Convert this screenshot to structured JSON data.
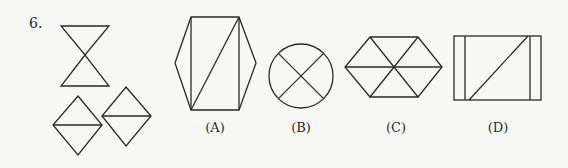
{
  "question": {
    "number": "6.",
    "figure_description": "Three given pieces: an hourglass (two triangles meeting at a point) and two squares rotated 45° each split by a horizontal line into two triangles.",
    "options": [
      {
        "label": "(A)",
        "shape": "hexagon divided by two verticals and one diagonal"
      },
      {
        "label": "(B)",
        "shape": "circle divided by an X"
      },
      {
        "label": "(C)",
        "shape": "regular hexagon divided into six triangles"
      },
      {
        "label": "(D)",
        "shape": "rectangle with two inner vertical lines and one diagonal"
      }
    ]
  },
  "colors": {
    "stroke": "#2a2a2a",
    "background": "#f7f7f5"
  }
}
